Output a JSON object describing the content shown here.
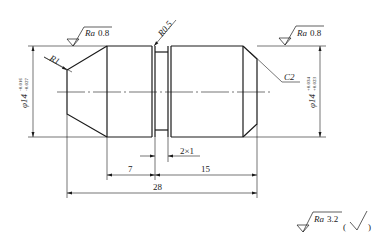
{
  "drawing": {
    "type": "shaft-part-engineering-drawing",
    "line_color": "#1a1a1a",
    "surface_roughness_top_left": {
      "prefix": "Ra",
      "value": "0.8"
    },
    "surface_roughness_top_right": {
      "prefix": "Ra",
      "value": "0.8"
    },
    "fillet_left": "R1",
    "fillet_groove": "R0.5",
    "chamfer_right": "C2",
    "diameter_left": {
      "nominal": "φ14",
      "upper": "-0.016",
      "lower": "-0.027"
    },
    "diameter_right": {
      "nominal": "φ14",
      "upper": "+0.034",
      "lower": "+0.023"
    },
    "groove_label": "2×1",
    "dimensions": {
      "d_7": "7",
      "d_15": "15",
      "d_28": "28"
    },
    "general_roughness": {
      "prefix": "Ra",
      "value": "3.2",
      "open_paren": "(",
      "close_paren": ")"
    }
  }
}
